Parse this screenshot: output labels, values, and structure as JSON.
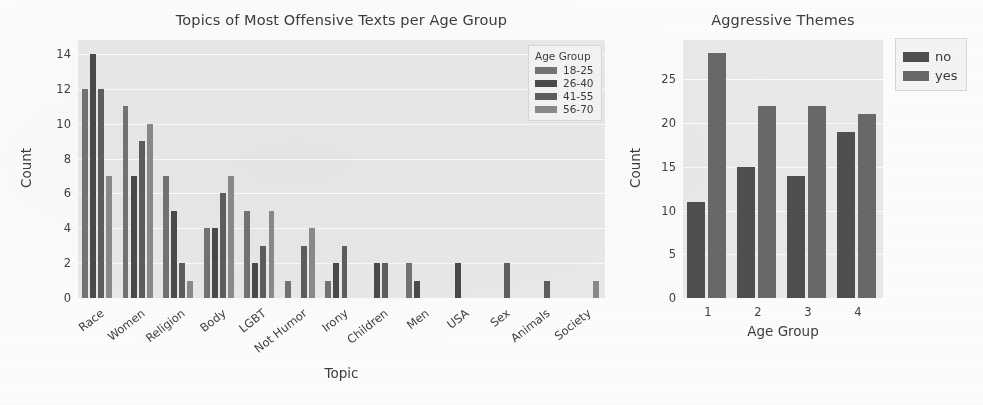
{
  "chart_data": [
    {
      "id": "topics",
      "type": "bar",
      "title": "Topics of Most Offensive Texts per Age Group",
      "xlabel": "Topic",
      "ylabel": "Count",
      "ylim": [
        0,
        14.8
      ],
      "yticks": [
        0,
        2,
        4,
        6,
        8,
        10,
        12,
        14
      ],
      "grid": true,
      "legend": {
        "title": "Age Group",
        "position": "upper right",
        "entries": [
          "18-25",
          "26-40",
          "41-55",
          "56-70"
        ]
      },
      "categories": [
        "Race",
        "Women",
        "Religion",
        "Body",
        "LGBT",
        "Not Humor",
        "Irony",
        "Children",
        "Men",
        "USA",
        "Sex",
        "Animals",
        "Society"
      ],
      "series": [
        {
          "name": "18-25",
          "color": "#737373",
          "values": [
            12,
            11,
            7,
            4,
            5,
            1,
            1,
            0,
            2,
            0,
            0,
            0,
            0
          ]
        },
        {
          "name": "26-40",
          "color": "#4a4a4a",
          "values": [
            14,
            7,
            5,
            4,
            2,
            0,
            2,
            2,
            1,
            2,
            0,
            0,
            0
          ]
        },
        {
          "name": "41-55",
          "color": "#5e5e5e",
          "values": [
            12,
            9,
            2,
            6,
            3,
            3,
            3,
            2,
            0,
            0,
            2,
            1,
            0
          ]
        },
        {
          "name": "56-70",
          "color": "#8a8a8a",
          "values": [
            7,
            10,
            1,
            7,
            5,
            4,
            0,
            0,
            0,
            0,
            0,
            0,
            1
          ]
        }
      ]
    },
    {
      "id": "aggressive",
      "type": "bar",
      "title": "Aggressive Themes",
      "xlabel": "Age Group",
      "ylabel": "Count",
      "ylim": [
        0,
        29.5
      ],
      "yticks": [
        0,
        5,
        10,
        15,
        20,
        25
      ],
      "grid": true,
      "legend": {
        "title": "",
        "position": "upper right outside",
        "entries": [
          "no",
          "yes"
        ]
      },
      "categories": [
        "1",
        "2",
        "3",
        "4"
      ],
      "series": [
        {
          "name": "no",
          "color": "#4f4f4f",
          "values": [
            11,
            15,
            14,
            19
          ]
        },
        {
          "name": "yes",
          "color": "#686868",
          "values": [
            28,
            22,
            22,
            21
          ]
        }
      ]
    }
  ],
  "figure": {
    "background": "#fcfcfb",
    "axes_background": "#e9e9e9",
    "gridline_color": "#fbfbfb",
    "text_color": "#3c3c3c"
  }
}
